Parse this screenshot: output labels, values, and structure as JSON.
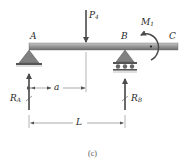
{
  "diagram": {
    "type": "simply-supported-beam-with-overhang",
    "caption": "(c)",
    "points": [
      {
        "id": "A",
        "label": "A"
      },
      {
        "id": "B",
        "label": "B"
      },
      {
        "id": "C",
        "label": "C"
      }
    ],
    "loads": {
      "point_load": {
        "symbol": "P",
        "subscript": "4"
      },
      "moment": {
        "symbol": "M",
        "subscript": "1",
        "direction": "counterclockwise"
      }
    },
    "reactions": {
      "RA": {
        "symbol": "R",
        "subscript": "A"
      },
      "RB": {
        "symbol": "R",
        "subscript": "B"
      }
    },
    "dimensions": {
      "a": "a",
      "L": "L"
    },
    "supports": {
      "A": "pin",
      "B": "roller"
    },
    "colors": {
      "beam": "#8a8a8a",
      "support": "#7a7a7a",
      "arrow": "#555555",
      "text": "#2a2a2a"
    }
  }
}
